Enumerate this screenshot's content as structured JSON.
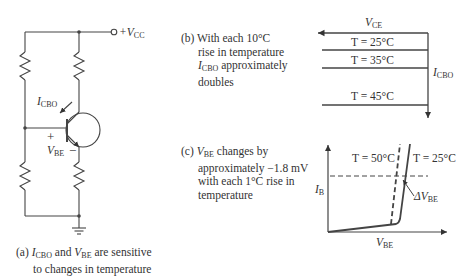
{
  "panel_a": {
    "vcc_label": "+V",
    "vcc_sub": "CC",
    "icbo_label": "I",
    "icbo_sub": "CBO",
    "plus": "+",
    "minus": "−",
    "vbe_label": "V",
    "vbe_sub": "BE",
    "caption_prefix": "(a) ",
    "caption_i": "I",
    "caption_i_sub": "CBO",
    "caption_and": " and ",
    "caption_v": "V",
    "caption_v_sub": "BE",
    "caption_rest": "  are sensitive",
    "caption_line2": "to changes in temperature"
  },
  "panel_b": {
    "caption_line1": "(b) With each 10°C",
    "caption_line2": "rise in temperature",
    "caption_i": "I",
    "caption_i_sub": "CBO",
    "caption_line3_rest": " approximately",
    "caption_line4": "doubles",
    "vce_label": "V",
    "vce_sub": "CE",
    "icbo_label": "I",
    "icbo_sub": "CBO",
    "curves": [
      {
        "label": "T = 25°C"
      },
      {
        "label": "T = 35°C"
      },
      {
        "label": "T = 45°C"
      }
    ]
  },
  "panel_c": {
    "caption_prefix": "(c) ",
    "caption_v": "V",
    "caption_v_sub": "BE",
    "caption_line1_rest": " changes by",
    "caption_line2": "approximately −1.8 mV",
    "caption_line3": "with each 1°C rise in",
    "caption_line4": "temperature",
    "t50_label": "T = 50°C",
    "t25_label": "T = 25°C",
    "ib_label": "I",
    "ib_sub": "B",
    "vbe_axis_label": "V",
    "vbe_axis_sub": "BE",
    "delta_label": "ΔV",
    "delta_sub": "BE"
  }
}
